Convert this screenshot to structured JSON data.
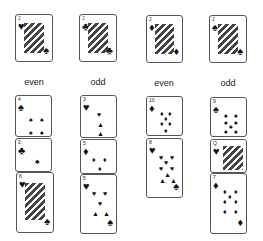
{
  "columns": [
    {
      "label": "even",
      "header_card": {
        "rank": "J",
        "suit": "♥"
      },
      "stack": [
        {
          "rank": "4",
          "suit": "♠"
        },
        {
          "rank": "2",
          "suit": "♣"
        },
        {
          "rank": "K",
          "suit": "♥"
        }
      ]
    },
    {
      "label": "odd",
      "header_card": {
        "rank": "J",
        "suit": "♣"
      },
      "stack": [
        {
          "rank": "3",
          "suit": "♥"
        },
        {
          "rank": "5",
          "suit": "♦"
        },
        {
          "rank": "5",
          "suit": "♥"
        }
      ]
    },
    {
      "label": "even",
      "header_card": {
        "rank": "J",
        "suit": "♦"
      },
      "stack": [
        {
          "rank": "10",
          "suit": "♦"
        },
        {
          "rank": "8",
          "suit": "♥"
        }
      ]
    },
    {
      "label": "odd",
      "header_card": {
        "rank": "J",
        "suit": "♠"
      },
      "stack": [
        {
          "rank": "9",
          "suit": "♠"
        },
        {
          "rank": "Q",
          "suit": "♥"
        },
        {
          "rank": "7",
          "suit": "♦"
        }
      ]
    }
  ]
}
